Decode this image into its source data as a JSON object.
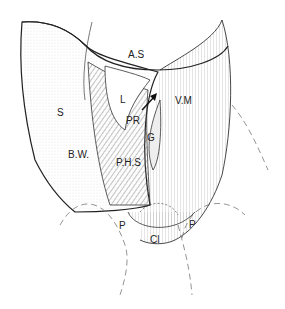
{
  "diagram": {
    "type": "anatomical line illustration",
    "labels": {
      "as": "A.S",
      "s": "S",
      "l": "L",
      "vm": "V.M",
      "pr": "PR",
      "g": "G",
      "bw": "B.W.",
      "phs": "P.H.S",
      "p_left": "P",
      "p_right": "P",
      "cl": "Cl"
    }
  }
}
